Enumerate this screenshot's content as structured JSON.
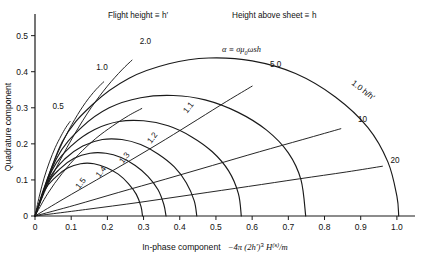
{
  "chart_data": {
    "type": "line",
    "title": "",
    "xlabel": "In-phase component   −4π (2h′)³ H⁽ˢ⁾/m",
    "ylabel": "Quadrature component",
    "xlim": [
      0,
      1.05
    ],
    "ylim": [
      0,
      0.56
    ],
    "xticks": [
      "0",
      "0.1",
      "0.2",
      "0.3",
      "0.4",
      "0.5",
      "0.6",
      "0.7",
      "0.8",
      "0.9",
      "1.0"
    ],
    "xtickvals": [
      0,
      0.1,
      0.2,
      0.3,
      0.4,
      0.5,
      0.6,
      0.7,
      0.8,
      0.9,
      1.0
    ],
    "yticks": [
      "0",
      "0.1",
      "0.2",
      "0.3",
      "0.4",
      "0.5"
    ],
    "ytickvals": [
      0,
      0.1,
      0.2,
      0.3,
      0.4,
      0.5
    ],
    "grid": false,
    "legend": "none",
    "annotations": [
      {
        "name": "flight-height-note",
        "text": "Flight height ≡ h′"
      },
      {
        "name": "height-above-sheet-note",
        "text": "Height above sheet ≡ h"
      },
      {
        "name": "alpha-definition",
        "text": "α ≡ σμ₀ωsh"
      },
      {
        "name": "h-ratio-axis-label",
        "text": "1.0 h/h′"
      }
    ],
    "series": [
      {
        "name": "alpha-0.5",
        "family": "alpha",
        "label": "0.5",
        "value": 0.5,
        "points": [
          [
            0.0,
            0.0
          ],
          [
            0.012,
            0.055
          ],
          [
            0.025,
            0.105
          ],
          [
            0.04,
            0.15
          ],
          [
            0.056,
            0.19
          ],
          [
            0.072,
            0.222
          ],
          [
            0.085,
            0.245
          ],
          [
            0.097,
            0.262
          ]
        ]
      },
      {
        "name": "alpha-1.0",
        "family": "alpha",
        "label": "1.0",
        "value": 1.0,
        "points": [
          [
            0.0,
            0.0
          ],
          [
            0.022,
            0.07
          ],
          [
            0.048,
            0.14
          ],
          [
            0.078,
            0.208
          ],
          [
            0.11,
            0.268
          ],
          [
            0.14,
            0.315
          ],
          [
            0.168,
            0.35
          ],
          [
            0.19,
            0.372
          ]
        ]
      },
      {
        "name": "alpha-1.5",
        "family": "alpha",
        "label": "1.5",
        "value": 1.5,
        "points": [
          [
            0.0,
            0.0
          ],
          [
            0.035,
            0.062
          ],
          [
            0.075,
            0.118
          ],
          [
            0.12,
            0.17
          ],
          [
            0.168,
            0.215
          ],
          [
            0.215,
            0.25
          ],
          [
            0.258,
            0.278
          ],
          [
            0.295,
            0.298
          ]
        ]
      },
      {
        "name": "alpha-2.0",
        "family": "alpha",
        "label": "2.0",
        "value": 2.0,
        "points": [
          [
            0.0,
            0.0
          ],
          [
            0.03,
            0.075
          ],
          [
            0.068,
            0.152
          ],
          [
            0.11,
            0.228
          ],
          [
            0.155,
            0.3
          ],
          [
            0.2,
            0.36
          ],
          [
            0.24,
            0.405
          ],
          [
            0.268,
            0.432
          ]
        ]
      },
      {
        "name": "alpha-5.0",
        "family": "alpha",
        "label": "5.0",
        "value": 5.0,
        "points": [
          [
            0.0,
            0.0
          ],
          [
            0.08,
            0.048
          ],
          [
            0.17,
            0.1
          ],
          [
            0.265,
            0.155
          ],
          [
            0.36,
            0.212
          ],
          [
            0.45,
            0.268
          ],
          [
            0.53,
            0.318
          ],
          [
            0.6,
            0.36
          ]
        ]
      },
      {
        "name": "alpha-10",
        "family": "alpha",
        "label": "10",
        "value": 10,
        "points": [
          [
            0.0,
            0.0
          ],
          [
            0.11,
            0.03
          ],
          [
            0.23,
            0.065
          ],
          [
            0.36,
            0.102
          ],
          [
            0.49,
            0.14
          ],
          [
            0.62,
            0.178
          ],
          [
            0.74,
            0.212
          ],
          [
            0.845,
            0.242
          ]
        ]
      },
      {
        "name": "alpha-20",
        "family": "alpha",
        "label": "20",
        "value": 20,
        "points": [
          [
            0.0,
            0.0
          ],
          [
            0.14,
            0.018
          ],
          [
            0.29,
            0.038
          ],
          [
            0.44,
            0.06
          ],
          [
            0.59,
            0.082
          ],
          [
            0.73,
            0.103
          ],
          [
            0.86,
            0.122
          ],
          [
            0.96,
            0.138
          ]
        ]
      },
      {
        "name": "h-ratio-1.0",
        "family": "h_ratio",
        "label": "1.0",
        "value": 1.0,
        "points": [
          [
            0.0,
            0.0
          ],
          [
            0.075,
            0.205
          ],
          [
            0.16,
            0.31
          ],
          [
            0.26,
            0.382
          ],
          [
            0.37,
            0.422
          ],
          [
            0.48,
            0.438
          ],
          [
            0.6,
            0.43
          ],
          [
            0.72,
            0.395
          ],
          [
            0.83,
            0.33
          ],
          [
            0.92,
            0.245
          ],
          [
            0.975,
            0.15
          ],
          [
            1.0,
            0.055
          ],
          [
            1.005,
            0.0
          ]
        ]
      },
      {
        "name": "h-ratio-1.1",
        "family": "h_ratio",
        "label": "1.1",
        "value": 1.1,
        "points": [
          [
            0.0,
            0.0
          ],
          [
            0.06,
            0.16
          ],
          [
            0.128,
            0.245
          ],
          [
            0.205,
            0.3
          ],
          [
            0.292,
            0.328
          ],
          [
            0.382,
            0.334
          ],
          [
            0.47,
            0.322
          ],
          [
            0.56,
            0.288
          ],
          [
            0.64,
            0.238
          ],
          [
            0.7,
            0.175
          ],
          [
            0.735,
            0.1
          ],
          [
            0.748,
            0.0
          ]
        ]
      },
      {
        "name": "h-ratio-1.2",
        "family": "h_ratio",
        "label": "1.2",
        "value": 1.2,
        "points": [
          [
            0.0,
            0.0
          ],
          [
            0.048,
            0.128
          ],
          [
            0.102,
            0.196
          ],
          [
            0.165,
            0.24
          ],
          [
            0.232,
            0.262
          ],
          [
            0.3,
            0.264
          ],
          [
            0.368,
            0.25
          ],
          [
            0.432,
            0.22
          ],
          [
            0.49,
            0.178
          ],
          [
            0.535,
            0.125
          ],
          [
            0.562,
            0.062
          ],
          [
            0.57,
            0.0
          ]
        ]
      },
      {
        "name": "h-ratio-1.3",
        "family": "h_ratio",
        "label": "1.3",
        "value": 1.3,
        "points": [
          [
            0.0,
            0.0
          ],
          [
            0.04,
            0.104
          ],
          [
            0.082,
            0.158
          ],
          [
            0.132,
            0.194
          ],
          [
            0.186,
            0.212
          ],
          [
            0.24,
            0.212
          ],
          [
            0.292,
            0.198
          ],
          [
            0.34,
            0.172
          ],
          [
            0.385,
            0.136
          ],
          [
            0.418,
            0.092
          ],
          [
            0.44,
            0.042
          ],
          [
            0.447,
            0.0
          ]
        ]
      },
      {
        "name": "h-ratio-1.4",
        "family": "h_ratio",
        "label": "1.4",
        "value": 1.4,
        "points": [
          [
            0.0,
            0.0
          ],
          [
            0.032,
            0.086
          ],
          [
            0.068,
            0.13
          ],
          [
            0.108,
            0.16
          ],
          [
            0.152,
            0.174
          ],
          [
            0.196,
            0.174
          ],
          [
            0.238,
            0.162
          ],
          [
            0.277,
            0.14
          ],
          [
            0.312,
            0.11
          ],
          [
            0.34,
            0.073
          ],
          [
            0.356,
            0.032
          ],
          [
            0.362,
            0.0
          ]
        ]
      },
      {
        "name": "h-ratio-1.5",
        "family": "h_ratio",
        "label": "1.5",
        "value": 1.5,
        "points": [
          [
            0.0,
            0.0
          ],
          [
            0.027,
            0.072
          ],
          [
            0.057,
            0.108
          ],
          [
            0.09,
            0.133
          ],
          [
            0.126,
            0.145
          ],
          [
            0.163,
            0.145
          ],
          [
            0.198,
            0.134
          ],
          [
            0.23,
            0.116
          ],
          [
            0.258,
            0.09
          ],
          [
            0.28,
            0.06
          ],
          [
            0.293,
            0.026
          ],
          [
            0.297,
            0.0
          ]
        ]
      }
    ],
    "curve_labels": [
      {
        "name": "curve-label-alpha-0.5",
        "text": "0.5",
        "x": 0.064,
        "y": 0.297,
        "rot": 0
      },
      {
        "name": "curve-label-alpha-1.0",
        "text": "1.0",
        "x": 0.185,
        "y": 0.405,
        "rot": 0
      },
      {
        "name": "curve-label-alpha-2.0",
        "text": "2.0",
        "x": 0.305,
        "y": 0.478,
        "rot": 0
      },
      {
        "name": "curve-label-alpha-5.0",
        "text": "5.0",
        "x": 0.665,
        "y": 0.413,
        "rot": 0
      },
      {
        "name": "curve-label-alpha-10",
        "text": "10",
        "x": 0.905,
        "y": 0.262,
        "rot": 0
      },
      {
        "name": "curve-label-alpha-20",
        "text": "20",
        "x": 0.995,
        "y": 0.148,
        "rot": 0
      },
      {
        "name": "curve-label-h-1.1",
        "text": "1.1",
        "x": 0.43,
        "y": 0.296,
        "rot": -52
      },
      {
        "name": "curve-label-h-1.2",
        "text": "1.2",
        "x": 0.33,
        "y": 0.212,
        "rot": -52
      },
      {
        "name": "curve-label-h-1.3",
        "text": "1.3",
        "x": 0.253,
        "y": 0.157,
        "rot": -52
      },
      {
        "name": "curve-label-h-1.4",
        "text": "1.4",
        "x": 0.188,
        "y": 0.118,
        "rot": -52
      },
      {
        "name": "curve-label-h-1.5",
        "text": "1.5",
        "x": 0.132,
        "y": 0.086,
        "rot": -52
      }
    ]
  },
  "axes": {
    "x_title_prefix": "In-phase component",
    "x_title_formula_a": "−4π (2h′)",
    "x_title_formula_exp": "3",
    "x_title_formula_b": "H",
    "x_title_formula_sup": "(s)",
    "x_title_formula_c": "/m",
    "y_title": "Quadrature component"
  },
  "notes": {
    "flight_height": "Flight height ≡ h′",
    "height_above_sheet": "Height above sheet ≡ h",
    "alpha_def_symbol": "α ≡ σμ",
    "alpha_def_sub": "0",
    "alpha_def_tail": "ωsh",
    "h_ratio_axis": "1.0 h/h′"
  },
  "style": {
    "line_color": "#1a1a1a",
    "axis_color": "#1a1a1a",
    "background": "#ffffff"
  }
}
